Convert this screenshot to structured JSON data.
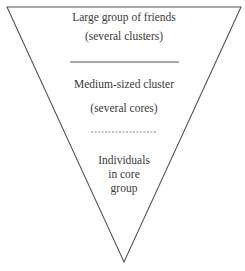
{
  "diagram": {
    "type": "inverted-triangle-funnel",
    "colors": {
      "stroke": "#555555",
      "text": "#3a3a3a",
      "background": "#ffffff"
    },
    "levels": [
      {
        "lines": [
          "Large group of friends",
          "(several clusters)"
        ],
        "separator_below": "solid"
      },
      {
        "lines": [
          "Medium-sized cluster",
          "(several cores)"
        ],
        "separator_below": "dashed"
      },
      {
        "lines": [
          "Individuals",
          "in core",
          "group"
        ],
        "separator_below": "none"
      }
    ]
  }
}
